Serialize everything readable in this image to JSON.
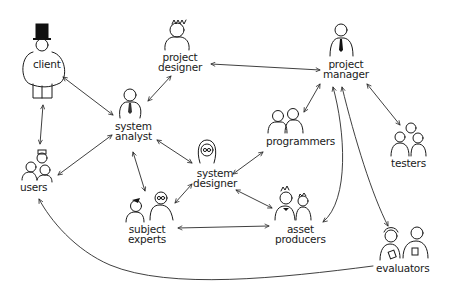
{
  "diagram": {
    "type": "stakeholder-network",
    "nodes": [
      {
        "id": "client",
        "lines": [
          "client"
        ]
      },
      {
        "id": "project_designer",
        "lines": [
          "project",
          "designer"
        ]
      },
      {
        "id": "project_manager",
        "lines": [
          "project",
          "manager"
        ]
      },
      {
        "id": "system_analyst",
        "lines": [
          "system",
          "analyst"
        ]
      },
      {
        "id": "programmers",
        "lines": [
          "programmers"
        ]
      },
      {
        "id": "testers",
        "lines": [
          "testers"
        ]
      },
      {
        "id": "users",
        "lines": [
          "users"
        ]
      },
      {
        "id": "system_designer",
        "lines": [
          "system",
          "designer"
        ]
      },
      {
        "id": "subject_experts",
        "lines": [
          "subject",
          "experts"
        ]
      },
      {
        "id": "asset_producers",
        "lines": [
          "asset",
          "producers"
        ]
      },
      {
        "id": "evaluators",
        "lines": [
          "evaluators"
        ]
      }
    ],
    "edges": [
      {
        "from": "client",
        "to": "system_analyst",
        "direction": "both"
      },
      {
        "from": "client",
        "to": "users",
        "direction": "both"
      },
      {
        "from": "project_designer",
        "to": "system_analyst",
        "direction": "both"
      },
      {
        "from": "project_designer",
        "to": "project_manager",
        "direction": "both"
      },
      {
        "from": "system_analyst",
        "to": "users",
        "direction": "both"
      },
      {
        "from": "system_analyst",
        "to": "system_designer",
        "direction": "both"
      },
      {
        "from": "system_analyst",
        "to": "subject_experts",
        "direction": "both"
      },
      {
        "from": "system_designer",
        "to": "programmers",
        "direction": "both"
      },
      {
        "from": "system_designer",
        "to": "subject_experts",
        "direction": "both"
      },
      {
        "from": "system_designer",
        "to": "asset_producers",
        "direction": "both"
      },
      {
        "from": "programmers",
        "to": "project_manager",
        "direction": "both"
      },
      {
        "from": "project_manager",
        "to": "testers",
        "direction": "both"
      },
      {
        "from": "project_manager",
        "to": "asset_producers",
        "direction": "both"
      },
      {
        "from": "project_manager",
        "to": "evaluators",
        "direction": "both"
      },
      {
        "from": "subject_experts",
        "to": "asset_producers",
        "direction": "both"
      },
      {
        "from": "evaluators",
        "to": "users",
        "direction": "forward"
      }
    ]
  }
}
